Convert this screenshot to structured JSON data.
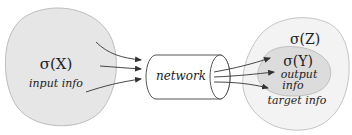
{
  "diagram": {
    "input": {
      "symbol": "σ(X)",
      "label": "input info",
      "fill": "#e6e6e6",
      "stroke": "#bdbdbd"
    },
    "network": {
      "label": "network",
      "shape": "cylinder",
      "fill": "#ffffff",
      "stroke": "#555555"
    },
    "target": {
      "outer_symbol": "σ(Z)",
      "outer_label": "target info",
      "outer_fill": "#f3f3f3",
      "outer_stroke": "#c4c4c4",
      "inner_symbol": "σ(Y)",
      "inner_label_line1": "output",
      "inner_label_line2": "info",
      "inner_fill": "#dcdcdc",
      "inner_stroke": "#c0c0c0"
    },
    "arrow_color": "#333333",
    "edges": [
      {
        "from": "input",
        "to": "network",
        "count": 3
      },
      {
        "from": "network",
        "to": "output",
        "count": 3
      }
    ]
  }
}
